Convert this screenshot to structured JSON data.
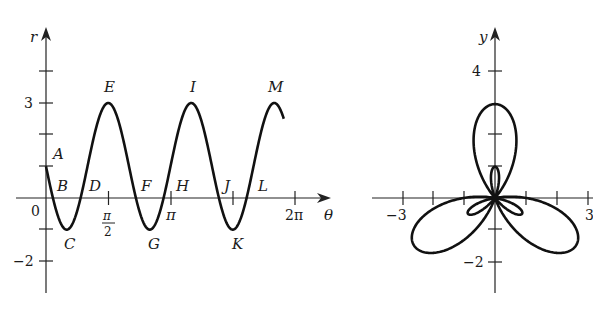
{
  "chart_data": [
    {
      "type": "line",
      "title": "",
      "xlabel": "θ",
      "ylabel": "r",
      "function": "r = 1 - 2 sin(3θ)",
      "x_range": [
        0,
        6.0
      ],
      "ylim": [
        -3,
        4
      ],
      "x_tick_labels": [
        "0",
        "π/2",
        "π",
        "2π"
      ],
      "y_tick_labels": [
        "3",
        "-2"
      ],
      "point_labels": [
        "A",
        "B",
        "C",
        "D",
        "E",
        "F",
        "G",
        "H",
        "I",
        "J",
        "K",
        "L",
        "M"
      ],
      "key_points": [
        {
          "label": "A",
          "theta": 0,
          "r": 1
        },
        {
          "label": "C",
          "theta": 0.524,
          "r": -1
        },
        {
          "label": "E",
          "theta": 1.571,
          "r": 3
        },
        {
          "label": "G",
          "theta": 2.618,
          "r": -1
        },
        {
          "label": "I",
          "theta": 3.665,
          "r": 3
        },
        {
          "label": "K",
          "theta": 4.712,
          "r": -1
        },
        {
          "label": "M",
          "theta": 5.76,
          "r": 3
        }
      ],
      "grid": false
    },
    {
      "type": "line",
      "title": "",
      "xlabel": "",
      "ylabel": "y",
      "description": "Polar curve r = 1 - 2 sin(3θ) plotted in the xy-plane: three large loops and three small inner loops",
      "xlim": [
        -3,
        3
      ],
      "ylim": [
        -3,
        5
      ],
      "x_tick_labels": [
        "-3",
        "3"
      ],
      "y_tick_labels": [
        "4",
        "-2"
      ],
      "grid": false
    }
  ],
  "left": {
    "r_label": "r",
    "theta_label": "θ",
    "zero": "0",
    "pi_half_num": "π",
    "pi_half_den": "2",
    "pi": "π",
    "two_pi": "2π",
    "y3": "3",
    "ym2": "−2",
    "points": [
      "A",
      "B",
      "C",
      "D",
      "E",
      "F",
      "G",
      "H",
      "I",
      "J",
      "K",
      "L",
      "M"
    ]
  },
  "right": {
    "y_label": "y",
    "y4": "4",
    "ym2": "−2",
    "xm3": "−3",
    "x3": "3"
  }
}
